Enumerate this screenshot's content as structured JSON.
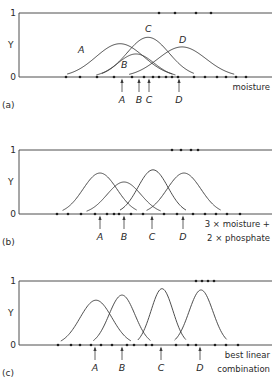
{
  "figure": {
    "y_axis_label": "Y",
    "y_tick_top": "1",
    "y_tick_bottom": "0",
    "panels": [
      {
        "id": "a",
        "panel_label": "(a)",
        "x_label_lines": [
          "moisture"
        ],
        "top_y": 13,
        "base_y": 77,
        "top_dots_x": [
          159,
          175,
          196,
          211
        ],
        "base_dots_x": [
          66,
          80,
          97,
          114,
          132,
          144,
          153,
          159,
          166,
          172,
          178,
          194,
          205,
          217,
          226,
          236,
          246
        ],
        "curves": [
          {
            "name": "A",
            "center": 120,
            "width": 24,
            "height": 0.52,
            "label_x": 78,
            "label_y": 53
          },
          {
            "name": "B",
            "center": 136,
            "width": 18,
            "height": 0.36,
            "label_x": 121,
            "label_y": 68
          },
          {
            "name": "C",
            "center": 148,
            "width": 21,
            "height": 0.62,
            "label_x": 145,
            "label_y": 32
          },
          {
            "name": "D",
            "center": 182,
            "width": 24,
            "height": 0.47,
            "label_x": 179,
            "label_y": 43
          }
        ],
        "arrows": [
          {
            "name": "A",
            "x": 122
          },
          {
            "name": "B",
            "x": 139
          },
          {
            "name": "C",
            "x": 149
          },
          {
            "name": "D",
            "x": 179
          }
        ]
      },
      {
        "id": "b",
        "panel_label": "(b)",
        "x_label_lines": [
          "3 × moisture +",
          "2 × phosphate"
        ],
        "top_y": 150,
        "base_y": 214,
        "top_dots_x": [
          172,
          181,
          191,
          198
        ],
        "base_dots_x": [
          57,
          68,
          81,
          95,
          107,
          114,
          119,
          131,
          143,
          164,
          177,
          193,
          205,
          216,
          227,
          240
        ],
        "curves": [
          {
            "name": "A",
            "center": 100,
            "width": 17,
            "height": 0.64,
            "label_x": null,
            "label_y": null
          },
          {
            "name": "B",
            "center": 124,
            "width": 17,
            "height": 0.5,
            "label_x": null,
            "label_y": null
          },
          {
            "name": "C",
            "center": 153,
            "width": 15,
            "height": 0.69,
            "label_x": null,
            "label_y": null
          },
          {
            "name": "D",
            "center": 184,
            "width": 17,
            "height": 0.64,
            "label_x": null,
            "label_y": null
          }
        ],
        "arrows": [
          {
            "name": "A",
            "x": 100
          },
          {
            "name": "B",
            "x": 124
          },
          {
            "name": "C",
            "x": 152
          },
          {
            "name": "D",
            "x": 183
          }
        ]
      },
      {
        "id": "c",
        "panel_label": "(c)",
        "x_label_lines": [
          "best linear",
          "combination"
        ],
        "top_y": 281,
        "base_y": 345,
        "top_dots_x": [
          196,
          202,
          208,
          214
        ],
        "base_dots_x": [
          58,
          71,
          80,
          91,
          101,
          112,
          127,
          134,
          146,
          152,
          176,
          188,
          196,
          215,
          226,
          238
        ],
        "curves": [
          {
            "name": "A",
            "center": 96,
            "width": 16,
            "height": 0.7,
            "label_x": null,
            "label_y": null
          },
          {
            "name": "B",
            "center": 122,
            "width": 13,
            "height": 0.78,
            "label_x": null,
            "label_y": null
          },
          {
            "name": "C",
            "center": 162,
            "width": 11,
            "height": 0.88,
            "label_x": null,
            "label_y": null
          },
          {
            "name": "D",
            "center": 201,
            "width": 12,
            "height": 0.86,
            "label_x": null,
            "label_y": null
          }
        ],
        "arrows": [
          {
            "name": "A",
            "x": 95
          },
          {
            "name": "B",
            "x": 122
          },
          {
            "name": "C",
            "x": 161
          },
          {
            "name": "D",
            "x": 200
          }
        ]
      }
    ]
  }
}
